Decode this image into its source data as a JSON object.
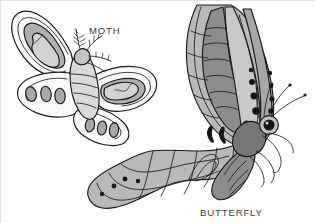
{
  "figure": {
    "kind": "illustration",
    "background_color": "#ffffff",
    "border_color": "#e2e2e2",
    "outline_color": "#1a1a1a",
    "width": 315,
    "height": 223
  },
  "labels": {
    "moth": "MOTH",
    "butterfly": "BUTTERFLY"
  },
  "palette": {
    "ink": "#1a1a1a",
    "white": "#fbfbfb",
    "light_gray": "#dcdcdc",
    "mid_gray": "#b4b4b4",
    "gray": "#9a9a9a",
    "dark_gray": "#7e7e7e",
    "darker_gray": "#6a6a6a",
    "black_spot": "#141414",
    "text": "#3a3a3a"
  },
  "moth": {
    "name": "moth",
    "label_text": "MOTH",
    "body_description": "stout furry body",
    "antenna_type": "feathery",
    "wing_fill": "#fbfbfb",
    "wing_accent": "#b4b4b4",
    "spot_count": 6,
    "spot_fill": "#a8a8a8",
    "wings": [
      "upper-left",
      "upper-right",
      "lower-left",
      "lower-right"
    ]
  },
  "butterfly": {
    "name": "butterfly",
    "label_text": "BUTTERFLY",
    "body_description": "slender striped abdomen",
    "antenna_type": "clubbed",
    "wing_fill": "#b9b9b9",
    "wing_accent": "#8d8d8d",
    "spot_count": 9,
    "spot_fill": "#141414",
    "wings": [
      "forewing",
      "hindwing-tail"
    ],
    "leg_count": 4
  }
}
